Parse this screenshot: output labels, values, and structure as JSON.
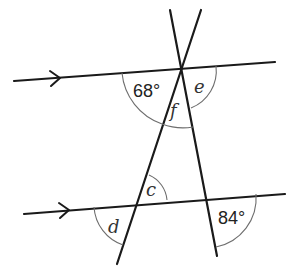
{
  "diagram": {
    "type": "parallel-lines-with-transversals",
    "colors": {
      "line": "#1a1a1a",
      "arc": "#6e6e6e",
      "text": "#222222"
    },
    "parallel_lines": [
      {
        "id": "top",
        "x1": 14,
        "y1": 81,
        "x2": 275,
        "y2": 62,
        "arrow_at": [
          60,
          78
        ]
      },
      {
        "id": "bottom",
        "x1": 24,
        "y1": 214,
        "x2": 285,
        "y2": 194,
        "arrow_at": [
          68,
          211
        ]
      }
    ],
    "transversals": [
      {
        "id": "left",
        "x1": 201,
        "y1": 10,
        "x2": 117,
        "y2": 264
      },
      {
        "id": "right",
        "x1": 170,
        "y1": 10,
        "x2": 217,
        "y2": 256
      }
    ],
    "angles": [
      {
        "id": "angle-68",
        "label": "68°",
        "kind": "value"
      },
      {
        "id": "angle-e",
        "label": "e",
        "kind": "variable"
      },
      {
        "id": "angle-f",
        "label": "f",
        "kind": "variable"
      },
      {
        "id": "angle-c",
        "label": "c",
        "kind": "variable"
      },
      {
        "id": "angle-d",
        "label": "d",
        "kind": "variable"
      },
      {
        "id": "angle-84",
        "label": "84°",
        "kind": "value"
      }
    ]
  }
}
